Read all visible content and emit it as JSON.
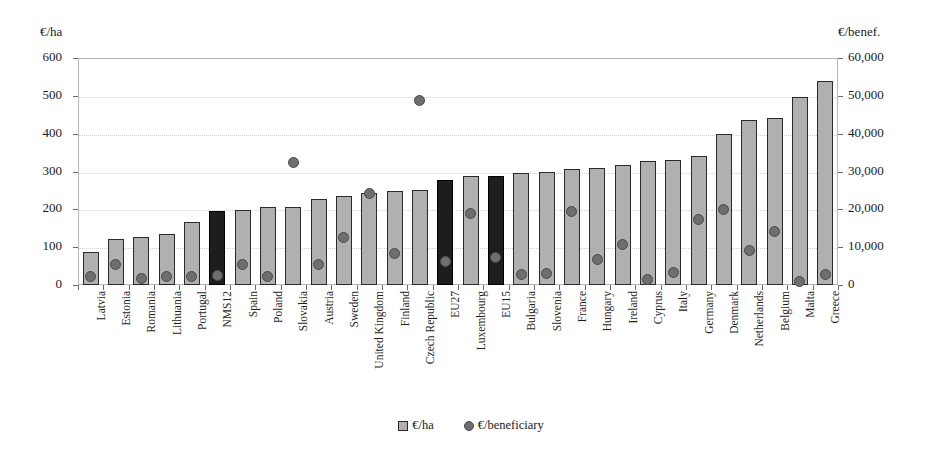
{
  "chart_data": {
    "type": "bar",
    "title": "",
    "xlabel": "",
    "ylabel": "€/ha",
    "y2label": "€/benef.",
    "ylim": [
      0,
      600
    ],
    "y2lim": [
      0,
      60000
    ],
    "grid": true,
    "legend_position": "bottom-center",
    "left_axis_title": "€/ha",
    "right_axis_title": "€/benef.",
    "left_ticks": [
      "0",
      "100",
      "200",
      "300",
      "400",
      "500",
      "600"
    ],
    "right_ticks": [
      "0",
      "10,000",
      "20,000",
      "30,000",
      "40,000",
      "50,000",
      "60,000"
    ],
    "left_tick_values": [
      0,
      100,
      200,
      300,
      400,
      500,
      600
    ],
    "right_tick_values": [
      0,
      10000,
      20000,
      30000,
      40000,
      50000,
      60000
    ],
    "categories": [
      "Latvia",
      "Estonia",
      "Romania",
      "Lithuania",
      "Portugal",
      "NMS12",
      "Spain",
      "Poland",
      "Slovakia",
      "Austria",
      "Sweden",
      "United Kingdom",
      "Finland",
      "Czech Republic",
      "EU27",
      "Luxembourg",
      "EU15",
      "Bulgaria",
      "Slovenia",
      "France",
      "Hungary",
      "Ireland",
      "Cyprus",
      "Italy",
      "Germany",
      "Denmark",
      "Netherlands",
      "Belgium",
      "Malta",
      "Greece"
    ],
    "highlighted_categories": [
      "NMS12",
      "EU27",
      "EU15"
    ],
    "series": [
      {
        "name": "€/ha",
        "axis": "left",
        "marker": "square",
        "color": "#b0b0b0",
        "highlight_color": "#1d1d1d",
        "values": [
          88,
          122,
          127,
          135,
          167,
          196,
          197,
          205,
          206,
          228,
          236,
          243,
          248,
          251,
          277,
          287,
          288,
          296,
          298,
          307,
          310,
          317,
          329,
          330,
          340,
          399,
          435,
          441,
          497,
          540
        ]
      },
      {
        "name": "€/beneficiary",
        "axis": "right",
        "marker": "circle",
        "color": "#6e6e6e",
        "values": [
          2200,
          5500,
          1600,
          2300,
          2300,
          2500,
          5500,
          2200,
          32500,
          5500,
          12600,
          24300,
          8400,
          48700,
          6100,
          18900,
          7200,
          2900,
          3000,
          19500,
          6700,
          10700,
          1400,
          3200,
          17200,
          19900,
          9000,
          14100,
          900,
          2800
        ]
      }
    ],
    "legend": [
      {
        "label": "€/ha",
        "marker": "square"
      },
      {
        "label": "€/beneficiary",
        "marker": "circle"
      }
    ]
  }
}
